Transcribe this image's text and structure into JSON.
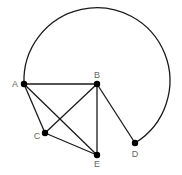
{
  "diagram": {
    "type": "graph",
    "width": 182,
    "height": 175,
    "colors": {
      "edge": "#1a1a1a",
      "node": "#000000",
      "label": "#666666",
      "background": "#ffffff"
    },
    "nodes": [
      {
        "id": "A",
        "label": "A",
        "x": 24,
        "y": 84,
        "label_x": 15,
        "label_y": 87
      },
      {
        "id": "B",
        "label": "B",
        "x": 97,
        "y": 84,
        "label_x": 97,
        "label_y": 78
      },
      {
        "id": "C",
        "label": "C",
        "x": 45,
        "y": 133,
        "label_x": 37,
        "label_y": 139
      },
      {
        "id": "D",
        "label": "D",
        "x": 135,
        "y": 143,
        "label_x": 135,
        "label_y": 157
      },
      {
        "id": "E",
        "label": "E",
        "x": 97,
        "y": 155,
        "label_x": 97,
        "label_y": 167
      }
    ],
    "edges": [
      {
        "from": "A",
        "to": "B"
      },
      {
        "from": "A",
        "to": "C"
      },
      {
        "from": "A",
        "to": "E"
      },
      {
        "from": "B",
        "to": "C"
      },
      {
        "from": "B",
        "to": "E"
      },
      {
        "from": "B",
        "to": "D"
      },
      {
        "from": "C",
        "to": "E"
      }
    ],
    "arcs": [
      {
        "from": "A",
        "to": "D",
        "center": "B",
        "radius": 73,
        "direction": "clockwise-over-top"
      }
    ]
  }
}
